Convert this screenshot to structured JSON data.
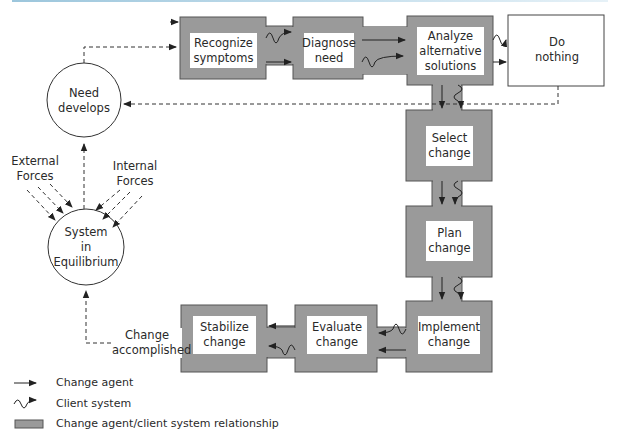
{
  "colors": {
    "box_fill": "#9a9a9a",
    "box_border": "#555555",
    "line": "#333333",
    "top_rule": "#9cc6dc"
  },
  "circles": {
    "need": {
      "line1": "Need",
      "line2": "develops"
    },
    "system": {
      "line1": "System",
      "line2": "in",
      "line3": "Equilibrium"
    }
  },
  "forces": {
    "external": {
      "line1": "External",
      "line2": "Forces"
    },
    "internal": {
      "line1": "Internal",
      "line2": "Forces"
    }
  },
  "steps": {
    "recognize": {
      "line1": "Recognize",
      "line2": "symptoms"
    },
    "diagnose": {
      "line1": "Diagnose",
      "line2": "need"
    },
    "analyze": {
      "line1": "Analyze",
      "line2": "alternative",
      "line3": "solutions"
    },
    "do_nothing": {
      "line1": "Do",
      "line2": "nothing"
    },
    "select": {
      "line1": "Select",
      "line2": "change"
    },
    "plan": {
      "line1": "Plan",
      "line2": "change"
    },
    "implement": {
      "line1": "Implement",
      "line2": "change"
    },
    "evaluate": {
      "line1": "Evaluate",
      "line2": "change"
    },
    "stabilize": {
      "line1": "Stabilize",
      "line2": "change"
    }
  },
  "change_accomplished": {
    "line1": "Change",
    "line2": "accomplished"
  },
  "legend": [
    {
      "icon": "arrow-icon",
      "label": "Change agent"
    },
    {
      "icon": "wavy-arrow-icon",
      "label": "Client system"
    },
    {
      "icon": "gray-box-icon",
      "label": "Change agent/client system relationship"
    }
  ]
}
